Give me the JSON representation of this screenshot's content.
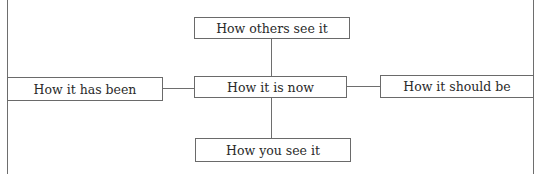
{
  "diagram": {
    "center": "How it is now",
    "top": "How others see it",
    "bottom": "How you see it",
    "left": "How it has been",
    "right": "How it should be"
  }
}
